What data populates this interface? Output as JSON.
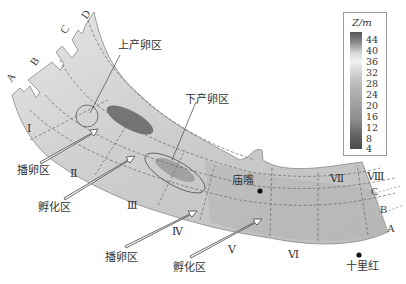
{
  "legend": {
    "title": "Z/m",
    "ticks": [
      "44",
      "40",
      "36",
      "32",
      "28",
      "24",
      "20",
      "16",
      "12",
      "8",
      "4"
    ],
    "colors": [
      "#555555",
      "#8a8a8a",
      "#d8d8d8",
      "#f2f2f2",
      "#cfcfcf",
      "#b8b8b8",
      "#a9a9a9",
      "#9a9a9a",
      "#8c8c8c",
      "#6a6a6a",
      "#4a4a4a"
    ]
  },
  "section_labels_upstream": [
    "A",
    "B",
    "C",
    "D"
  ],
  "section_labels_downstream": [
    "C",
    "B",
    "A"
  ],
  "reach_labels": [
    "Ⅰ",
    "Ⅱ",
    "Ⅲ",
    "Ⅳ",
    "Ⅴ",
    "Ⅵ",
    "Ⅶ",
    "Ⅷ"
  ],
  "zones": {
    "upper_spawning": "上产卵区",
    "lower_spawning": "下产卵区",
    "spawn_area_1": "播卵区",
    "hatch_area_1": "孵化区",
    "spawn_area_2": "播卵区",
    "hatch_area_2": "孵化区"
  },
  "places": {
    "miaozui": "庙嘴",
    "shilihong": "十里红"
  }
}
